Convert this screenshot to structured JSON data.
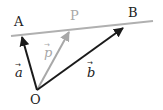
{
  "diagram": {
    "title": "",
    "colors": {
      "line": "#b0b0b0",
      "dark_vector": "#1a1a1a",
      "light_vector": "#a8a8a8",
      "label_dark": "#222222",
      "label_light": "#a8a8a8"
    },
    "points": {
      "A": {
        "label": "A"
      },
      "B": {
        "label": "B"
      },
      "P": {
        "label": "P"
      },
      "O": {
        "label": "O"
      }
    },
    "vectors": {
      "a": {
        "label": "a",
        "arrow": "→",
        "from": "O",
        "to": "A"
      },
      "b": {
        "label": "b",
        "arrow": "→",
        "from": "O",
        "to": "B"
      },
      "p": {
        "label": "p",
        "arrow": "→",
        "from": "O",
        "to": "P"
      }
    },
    "line": {
      "through": [
        "A",
        "P",
        "B"
      ]
    }
  }
}
